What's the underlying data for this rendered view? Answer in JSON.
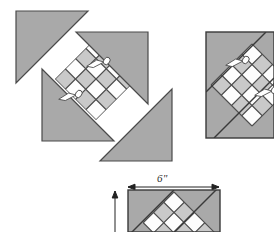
{
  "figure": {
    "type": "sewing-instruction-diagram",
    "background_color": "#ffffff"
  },
  "colors": {
    "fabric_gray": "#a9a9a9",
    "fabric_gray_light": "#c9c9c9",
    "fabric_white": "#fdfdfd",
    "outline_dark": "#3a3a3a",
    "outline_mid": "#6b6b6b",
    "pin_white": "#ffffff",
    "pin_outline": "#4a4a4a",
    "dimension_line": "#222222",
    "text": "#2b2b2b"
  },
  "dimensions": {
    "width_label": "6\"",
    "width_unit": "inches",
    "width_value": 6,
    "height_label": "",
    "arrow_style": "double-headed"
  },
  "panels": [
    {
      "id": "pinwheel-assembly",
      "name": "Pinwheel triangle assembly",
      "description": "Four gray right triangles arranged pinwheel-style around a central diagonal checkerboard of squares, held with pins",
      "triangle_count": 4,
      "pin_count": 2,
      "position": {
        "x": 8,
        "y": 8,
        "width": 175,
        "height": 158
      }
    },
    {
      "id": "finished-block",
      "name": "Finished block, right",
      "description": "Square block with diagonal checkerboard center and pinned corner triangles",
      "pin_count": 2,
      "position": {
        "x": 205,
        "y": 31,
        "width": 69,
        "height": 108
      }
    },
    {
      "id": "measured-block",
      "name": "Measured block, bottom",
      "description": "Block shown with 6 inch width dimension arrow and height dimension arrow",
      "position": {
        "x": 127,
        "y": 189,
        "width": 94,
        "height": 43
      }
    }
  ],
  "icons": {
    "pin": "straight-pin-with-looped-head",
    "arrow": "dimension-arrowhead"
  }
}
